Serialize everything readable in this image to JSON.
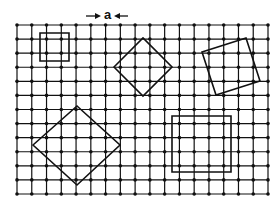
{
  "figure": {
    "label_a": "a",
    "colors": {
      "line": "#111111",
      "background": "#ffffff"
    },
    "grid": {
      "x0": 17,
      "x1": 268,
      "cols": 17,
      "y0": 25,
      "y1": 194,
      "rows": 12,
      "dots": true
    },
    "dimension_marker": {
      "text": "a",
      "left_arrow_x": [
        86,
        101
      ],
      "right_arrow_x": [
        128,
        114
      ],
      "y": 16
    },
    "shapes": [
      {
        "name": "small-square",
        "points": [
          [
            40,
            33
          ],
          [
            69,
            33
          ],
          [
            69,
            61
          ],
          [
            40,
            61
          ]
        ]
      },
      {
        "name": "rotated-diamond-top",
        "points": [
          [
            114,
            67
          ],
          [
            143,
            38
          ],
          [
            172,
            67
          ],
          [
            143,
            96
          ]
        ]
      },
      {
        "name": "tilted-square-right",
        "points": [
          [
            202,
            52
          ],
          [
            246,
            38
          ],
          [
            260,
            81
          ],
          [
            216,
            95
          ]
        ]
      },
      {
        "name": "large-diamond",
        "points": [
          [
            33,
            145
          ],
          [
            77,
            106
          ],
          [
            120,
            145
          ],
          [
            77,
            185
          ]
        ]
      },
      {
        "name": "large-square",
        "points": [
          [
            172,
            116
          ],
          [
            231,
            116
          ],
          [
            231,
            172
          ],
          [
            172,
            172
          ]
        ]
      }
    ]
  }
}
